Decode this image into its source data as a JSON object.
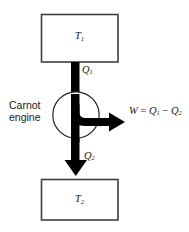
{
  "diagram": {
    "background_color": "#ffffff",
    "stroke_color": "#231f20",
    "fill_color": "#000000",
    "box_border_color": "#3f3f3f",
    "reservoir_hot": {
      "label": "T",
      "subscript": "1"
    },
    "reservoir_cold": {
      "label": "T",
      "subscript": "2"
    },
    "engine": {
      "name_line1": "Carnot",
      "name_line2": "engine"
    },
    "heat_in": {
      "label": "Q",
      "subscript": "1"
    },
    "heat_out": {
      "label": "Q",
      "subscript": "2"
    },
    "work": {
      "symbol": "W",
      "equals": "=",
      "term1": "Q",
      "term1_sub": "1",
      "minus": "−",
      "term2": "Q",
      "term2_sub": "2"
    }
  }
}
